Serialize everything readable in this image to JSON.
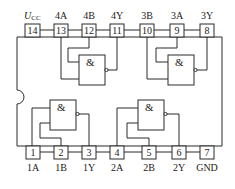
{
  "diagram": {
    "type": "ic-pinout",
    "gate_symbol": "&",
    "top_pins": [
      {
        "number": "14",
        "label": "U",
        "sub": "CC"
      },
      {
        "number": "13",
        "label": "4A"
      },
      {
        "number": "12",
        "label": "4B"
      },
      {
        "number": "11",
        "label": "4Y"
      },
      {
        "number": "10",
        "label": "3B"
      },
      {
        "number": "9",
        "label": "3A"
      },
      {
        "number": "8",
        "label": "3Y"
      }
    ],
    "bottom_pins": [
      {
        "number": "1",
        "label": "1A"
      },
      {
        "number": "2",
        "label": "1B"
      },
      {
        "number": "3",
        "label": "1Y"
      },
      {
        "number": "4",
        "label": "2A"
      },
      {
        "number": "5",
        "label": "2B"
      },
      {
        "number": "6",
        "label": "2Y"
      },
      {
        "number": "7",
        "label": "GND"
      }
    ],
    "gates": [
      {
        "name": "gate-4",
        "symbol": "&"
      },
      {
        "name": "gate-3",
        "symbol": "&"
      },
      {
        "name": "gate-1",
        "symbol": "&"
      },
      {
        "name": "gate-2",
        "symbol": "&"
      }
    ]
  }
}
